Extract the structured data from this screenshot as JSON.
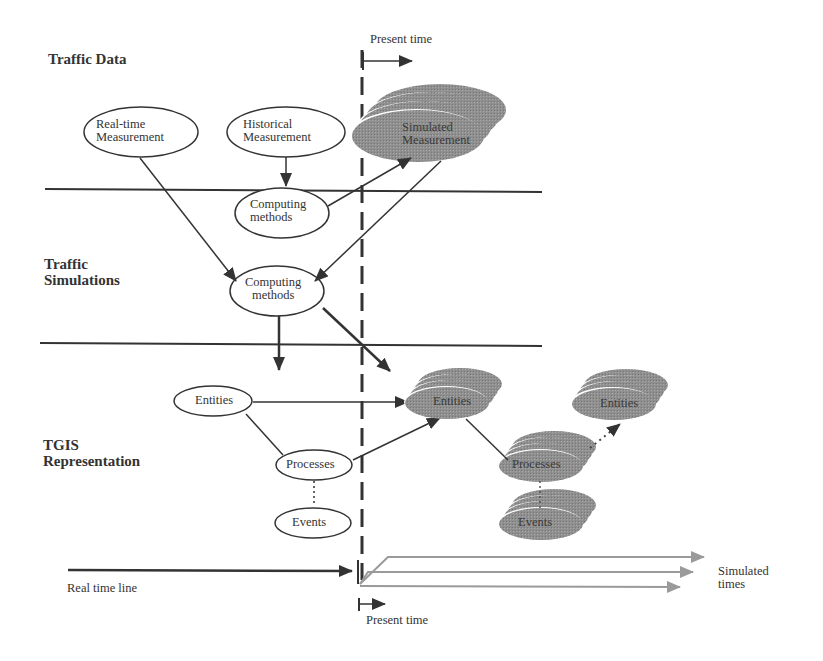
{
  "sections": {
    "traffic_data": "Traffic Data",
    "traffic_simulations": [
      "Traffic",
      "Simulations"
    ],
    "tgis_representation": [
      "TGIS",
      "Representation"
    ]
  },
  "nodes": {
    "realtime_measurement": [
      "Real-time",
      "Measurement"
    ],
    "historical_measurement": [
      "Historical",
      "Measurement"
    ],
    "computing_methods_1": [
      "Computing",
      "methods"
    ],
    "computing_methods_2": [
      "Computing",
      "methods"
    ],
    "entities": "Entities",
    "processes": "Processes",
    "events": "Events",
    "simulated_measurement": [
      "Simulated",
      "Measurement"
    ],
    "sim_entities_1": "Entities",
    "sim_processes": "Processes",
    "sim_events": "Events",
    "sim_entities_2": "Entities"
  },
  "timeline": {
    "present_time_top": "Present time",
    "present_time_bottom": "Present time",
    "real_time_line": "Real time line",
    "simulated_times": [
      "Simulated",
      "times"
    ]
  },
  "colors": {
    "line": "#333333",
    "simulated_fill": "#8f8f8f",
    "simulated_arrow": "#9a9a9a"
  }
}
